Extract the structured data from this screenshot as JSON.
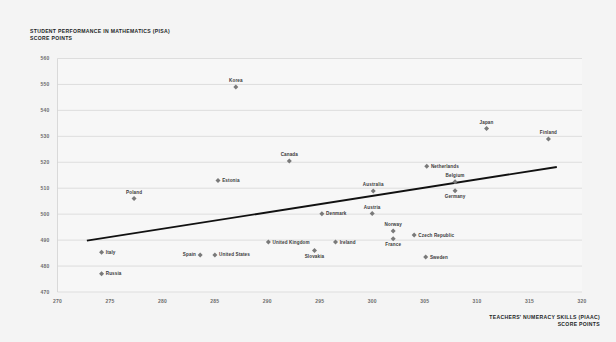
{
  "title": {
    "line1": "STUDENT PERFORMANCE IN MATHEMATICS (PISA)",
    "line2": "SCORE POINTS"
  },
  "x_axis_label": {
    "line1": "TEACHERS' NUMERACY SKILLS (PIAAC)",
    "line2": "SCORE POINTS"
  },
  "colors": {
    "background": "#f4f4f4",
    "plot_background": "#f7f7f7",
    "gridline": "#d2d2d2",
    "marker": "#7a7a7a",
    "trendline": "#111111",
    "tick_text": "#6d6d6d",
    "label_text": "#3b3b3b",
    "title_text": "#221f1f"
  },
  "chart_data": {
    "type": "scatter",
    "title": "STUDENT PERFORMANCE IN MATHEMATICS (PISA) SCORE POINTS",
    "xlabel": "TEACHERS' NUMERACY SKILLS (PIAAC) SCORE POINTS",
    "ylabel": "STUDENT PERFORMANCE IN MATHEMATICS (PISA) SCORE POINTS",
    "xlim": [
      270,
      320
    ],
    "ylim": [
      470,
      560
    ],
    "xticks": [
      270,
      275,
      280,
      285,
      290,
      295,
      300,
      305,
      310,
      315,
      320
    ],
    "yticks": [
      470,
      480,
      490,
      500,
      510,
      520,
      530,
      540,
      550,
      560
    ],
    "grid": "horizontal",
    "legend": "none",
    "points": [
      {
        "label": "Russia",
        "x": 274.2,
        "y": 477.0,
        "label_pos": "right"
      },
      {
        "label": "Italy",
        "x": 274.2,
        "y": 485.3,
        "label_pos": "right"
      },
      {
        "label": "Poland",
        "x": 277.3,
        "y": 506.0,
        "label_pos": "above"
      },
      {
        "label": "Spain",
        "x": 283.6,
        "y": 484.3,
        "label_pos": "left"
      },
      {
        "label": "United States",
        "x": 285.0,
        "y": 484.3,
        "label_pos": "right"
      },
      {
        "label": "Estonia",
        "x": 285.3,
        "y": 513.0,
        "label_pos": "right"
      },
      {
        "label": "Korea",
        "x": 287.0,
        "y": 549.0,
        "label_pos": "above"
      },
      {
        "label": "United Kingdom",
        "x": 290.1,
        "y": 489.3,
        "label_pos": "right"
      },
      {
        "label": "Canada",
        "x": 292.1,
        "y": 520.5,
        "label_pos": "above"
      },
      {
        "label": "Slovakia",
        "x": 294.5,
        "y": 486.0,
        "label_pos": "below"
      },
      {
        "label": "Denmark",
        "x": 295.2,
        "y": 500.2,
        "label_pos": "right"
      },
      {
        "label": "Ireland",
        "x": 296.5,
        "y": 489.3,
        "label_pos": "right"
      },
      {
        "label": "Austria",
        "x": 300.0,
        "y": 500.3,
        "label_pos": "above"
      },
      {
        "label": "Australia",
        "x": 300.1,
        "y": 508.9,
        "label_pos": "above"
      },
      {
        "label": "Norway",
        "x": 302.0,
        "y": 493.5,
        "label_pos": "above"
      },
      {
        "label": "France",
        "x": 302.0,
        "y": 490.5,
        "label_pos": "below"
      },
      {
        "label": "Czech Republic",
        "x": 304.0,
        "y": 492.0,
        "label_pos": "right"
      },
      {
        "label": "Sweden",
        "x": 305.1,
        "y": 483.5,
        "label_pos": "right"
      },
      {
        "label": "Netherlands",
        "x": 305.2,
        "y": 518.5,
        "label_pos": "right"
      },
      {
        "label": "Belgium",
        "x": 307.9,
        "y": 512.5,
        "label_pos": "above"
      },
      {
        "label": "Germany",
        "x": 307.9,
        "y": 509.0,
        "label_pos": "below"
      },
      {
        "label": "Japan",
        "x": 310.9,
        "y": 533.0,
        "label_pos": "above"
      },
      {
        "label": "Finland",
        "x": 316.8,
        "y": 529.0,
        "label_pos": "above"
      }
    ],
    "trendline": {
      "x1": 272.8,
      "y1": 489.8,
      "x2": 317.6,
      "y2": 518.2
    }
  }
}
